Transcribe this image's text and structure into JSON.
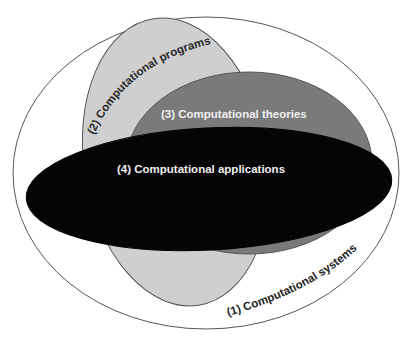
{
  "diagram": {
    "type": "nested-ellipse-venn",
    "sets": [
      {
        "id": 1,
        "label": "(1) Computational systems",
        "fill": "#ffffff",
        "stroke": "#555555",
        "text_color": "#222222"
      },
      {
        "id": 2,
        "label": "(2) Computational programs",
        "fill": "#cfcfcf",
        "stroke": "#555555",
        "text_color": "#2a2a2a"
      },
      {
        "id": 3,
        "label": "(3) Computational theories",
        "fill": "#7a7a7a",
        "stroke": "#555555",
        "text_color": "#f0f0f0"
      },
      {
        "id": 4,
        "label": "(4) Computational applications",
        "fill": "#050505",
        "stroke": "#000000",
        "text_color": "#f0f0f0"
      }
    ]
  }
}
